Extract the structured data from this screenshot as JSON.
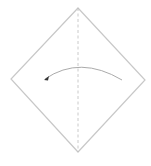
{
  "diagram": {
    "type": "origami-fold-step",
    "paper": {
      "shape": "square-rotated-45",
      "vertices": {
        "top": [
          78,
          8
        ],
        "right": [
          145,
          80
        ],
        "bottom": [
          78,
          152
        ],
        "left": [
          11,
          79
        ]
      },
      "edge_color": "#c8c8c8",
      "fill_color": "#ffffff"
    },
    "fold_line": {
      "style": "valley-dashed",
      "from": [
        78,
        8
      ],
      "to": [
        78,
        152
      ],
      "color": "#bdbdbd"
    },
    "arrow": {
      "direction": "right-to-left",
      "start": [
        122,
        80
      ],
      "control": [
        80,
        55
      ],
      "end": [
        45,
        79
      ],
      "color": "#a0a0a0",
      "head_color": "#333333"
    }
  }
}
